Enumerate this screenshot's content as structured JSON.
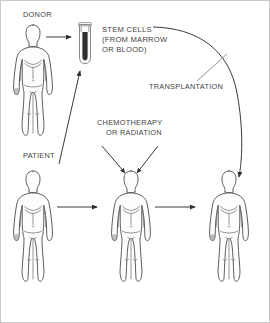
{
  "diagram": {
    "background_color": "#ffffff",
    "line_color": "#3a3a3a",
    "text_color": "#3f3f3f",
    "labels": {
      "donor": "DONOR",
      "patient": "PATIENT",
      "stem_cells_line1": "STEM CELLS",
      "stem_cells_line2": "(FROM MARROW",
      "stem_cells_line3": "OR BLOOD)",
      "transplantation": "TRANSPLANTATION",
      "chemotherapy_line1": "CHEMOTHERAPY",
      "chemotherapy_line2": "OR RADIATION"
    },
    "figures": [
      {
        "id": "donor-figure",
        "role": "donor",
        "label": "DONOR"
      },
      {
        "id": "patient-figure",
        "role": "patient-before",
        "label": "PATIENT"
      },
      {
        "id": "patient-treated-figure",
        "role": "patient-treated",
        "label": ""
      },
      {
        "id": "patient-transplanted-figure",
        "role": "patient-after-transplant",
        "label": ""
      }
    ],
    "objects": [
      {
        "id": "test-tube",
        "name": "test-tube",
        "contents": "stem cells",
        "contents_color": "#2e2e2e"
      }
    ],
    "arrows": [
      {
        "id": "donor-to-tube",
        "from": "donor-figure",
        "to": "test-tube",
        "style": "straight"
      },
      {
        "id": "patient-to-tube",
        "from": "patient-figure",
        "to": "test-tube",
        "style": "diagonal"
      },
      {
        "id": "stemcells-to-patient3",
        "from": "test-tube",
        "to": "patient-transplanted-figure",
        "style": "curved",
        "label": "TRANSPLANTATION"
      },
      {
        "id": "chemo-left",
        "from": "chemotherapy-label",
        "to": "patient-treated-figure",
        "style": "straight"
      },
      {
        "id": "chemo-right",
        "from": "chemotherapy-label",
        "to": "patient-treated-figure",
        "style": "straight"
      },
      {
        "id": "patient1-to-patient2",
        "from": "patient-figure",
        "to": "patient-treated-figure",
        "style": "straight"
      },
      {
        "id": "patient2-to-patient3",
        "from": "patient-treated-figure",
        "to": "patient-transplanted-figure",
        "style": "straight"
      }
    ]
  }
}
